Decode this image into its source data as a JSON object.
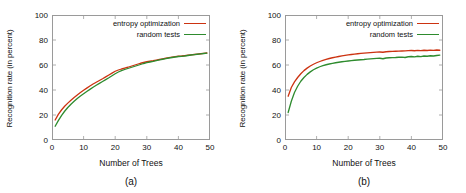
{
  "figure": {
    "panels": [
      {
        "caption": "(a)",
        "xlabel": "Number of Trees",
        "ylabel": "Recognition rate (in percent)",
        "legend": [
          {
            "label": "entropy optimization",
            "color": "#cc3311"
          },
          {
            "label": "random tests",
            "color": "#2e8b2e"
          }
        ],
        "chart_data": {
          "type": "line",
          "title": "",
          "xlabel": "Number of Trees",
          "ylabel": "Recognition rate (in percent)",
          "xlim": [
            0,
            50
          ],
          "ylim": [
            0,
            100
          ],
          "xticks": [
            0,
            10,
            20,
            30,
            40,
            50
          ],
          "yticks": [
            0,
            20,
            40,
            60,
            80,
            100
          ],
          "grid": false,
          "legend_position": "top-right",
          "x": [
            1,
            2,
            3,
            4,
            5,
            6,
            7,
            8,
            9,
            10,
            11,
            12,
            13,
            14,
            15,
            16,
            17,
            18,
            19,
            20,
            21,
            22,
            23,
            24,
            25,
            26,
            27,
            28,
            29,
            30,
            31,
            32,
            33,
            34,
            35,
            36,
            37,
            38,
            39,
            40,
            41,
            42,
            43,
            44,
            45,
            46,
            47,
            48,
            49
          ],
          "series": [
            {
              "name": "entropy optimization",
              "color": "#cc3311",
              "values": [
                16.0,
                20.5,
                24.0,
                27.0,
                29.5,
                31.8,
                34.0,
                36.0,
                38.0,
                39.8,
                41.5,
                43.2,
                44.8,
                46.2,
                47.6,
                49.0,
                50.5,
                52.0,
                53.5,
                55.0,
                56.0,
                56.8,
                57.5,
                58.2,
                59.0,
                59.8,
                60.6,
                61.4,
                62.0,
                62.6,
                63.0,
                63.4,
                63.9,
                64.4,
                64.9,
                65.4,
                65.9,
                66.3,
                66.7,
                67.0,
                67.2,
                67.5,
                67.8,
                68.1,
                68.4,
                68.7,
                69.0,
                69.3,
                69.6
              ]
            },
            {
              "name": "random tests",
              "color": "#2e8b2e",
              "values": [
                11.0,
                15.5,
                19.5,
                23.0,
                26.0,
                28.6,
                31.0,
                33.2,
                35.2,
                37.0,
                38.8,
                40.5,
                42.2,
                43.8,
                45.3,
                46.8,
                48.3,
                49.8,
                51.4,
                53.0,
                54.4,
                55.5,
                56.4,
                57.2,
                58.0,
                58.8,
                59.6,
                60.4,
                61.2,
                61.9,
                62.4,
                62.9,
                63.5,
                64.1,
                64.6,
                65.1,
                65.6,
                66.0,
                66.4,
                66.8,
                66.9,
                67.2,
                67.6,
                68.0,
                68.3,
                68.6,
                68.9,
                69.2,
                69.5
              ]
            }
          ]
        }
      },
      {
        "caption": "(b)",
        "xlabel": "Number of Trees",
        "ylabel": "Recognition rate (in percent)",
        "legend": [
          {
            "label": "entropy optimization",
            "color": "#cc3311"
          },
          {
            "label": "random tests",
            "color": "#2e8b2e"
          }
        ],
        "chart_data": {
          "type": "line",
          "title": "",
          "xlabel": "Number of Trees",
          "ylabel": "Recognition rate (in percent)",
          "xlim": [
            0,
            50
          ],
          "ylim": [
            0,
            100
          ],
          "xticks": [
            0,
            10,
            20,
            30,
            40,
            50
          ],
          "yticks": [
            0,
            20,
            40,
            60,
            80,
            100
          ],
          "grid": false,
          "legend_position": "top-right",
          "x": [
            1,
            2,
            3,
            4,
            5,
            6,
            7,
            8,
            9,
            10,
            11,
            12,
            13,
            14,
            15,
            16,
            17,
            18,
            19,
            20,
            21,
            22,
            23,
            24,
            25,
            26,
            27,
            28,
            29,
            30,
            31,
            32,
            33,
            34,
            35,
            36,
            37,
            38,
            39,
            40,
            41,
            42,
            43,
            44,
            45,
            46,
            47,
            48,
            49
          ],
          "series": [
            {
              "name": "entropy optimization",
              "color": "#cc3311",
              "values": [
                35.0,
                42.0,
                46.5,
                50.0,
                53.0,
                55.5,
                57.5,
                59.2,
                60.6,
                61.8,
                62.8,
                63.7,
                64.5,
                65.2,
                65.8,
                66.3,
                66.8,
                67.3,
                67.7,
                68.1,
                68.4,
                68.7,
                69.0,
                69.3,
                69.5,
                69.7,
                69.9,
                70.1,
                70.3,
                70.4,
                70.2,
                70.6,
                70.8,
                70.9,
                71.0,
                71.1,
                71.2,
                71.3,
                71.5,
                71.6,
                71.4,
                71.7,
                71.5,
                71.8,
                71.6,
                71.9,
                71.7,
                72.0,
                71.8
              ]
            },
            {
              "name": "random tests",
              "color": "#2e8b2e",
              "values": [
                22.0,
                31.0,
                38.0,
                43.0,
                47.0,
                50.0,
                52.5,
                54.5,
                56.2,
                57.5,
                58.6,
                59.5,
                60.2,
                60.8,
                61.3,
                61.8,
                62.2,
                62.6,
                62.9,
                63.2,
                63.5,
                63.8,
                64.0,
                64.2,
                64.4,
                64.7,
                64.9,
                65.1,
                65.3,
                65.4,
                65.0,
                65.6,
                65.8,
                65.9,
                66.0,
                66.2,
                66.3,
                66.0,
                66.6,
                66.8,
                66.5,
                67.0,
                66.7,
                67.2,
                67.0,
                67.4,
                67.2,
                67.6,
                67.9
              ]
            }
          ]
        }
      }
    ]
  }
}
